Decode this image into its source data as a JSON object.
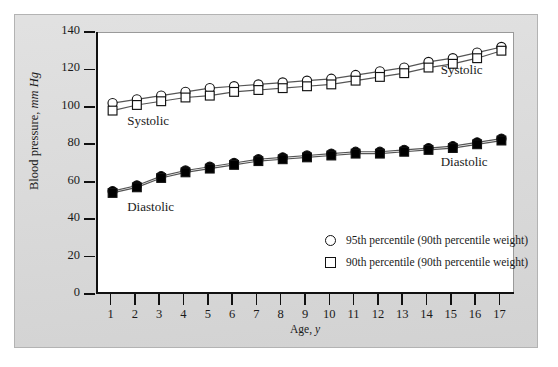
{
  "chart_data": {
    "type": "line",
    "title": "",
    "xlabel": "Age, y",
    "ylabel": "Blood pressure, mm Hg",
    "xlim": [
      0.4,
      17.6
    ],
    "ylim": [
      0,
      140
    ],
    "xticks": [
      1,
      2,
      3,
      4,
      5,
      6,
      7,
      8,
      9,
      10,
      11,
      12,
      13,
      14,
      15,
      16,
      17
    ],
    "yticks": [
      0,
      20,
      40,
      60,
      80,
      100,
      120,
      140
    ],
    "grid": false,
    "legend_position": "inside-bottom-right",
    "x": [
      1,
      2,
      3,
      4,
      5,
      6,
      7,
      8,
      9,
      10,
      11,
      12,
      13,
      14,
      15,
      16,
      17
    ],
    "series": [
      {
        "name": "Systolic 95th percentile (90th percentile weight)",
        "group": "Systolic",
        "marker": "open-circle",
        "values": [
          102,
          104,
          106,
          108,
          110,
          111,
          112,
          113,
          114,
          115,
          117,
          119,
          121,
          124,
          126,
          129,
          132
        ]
      },
      {
        "name": "Systolic 90th percentile (90th percentile weight)",
        "group": "Systolic",
        "marker": "open-square",
        "values": [
          98,
          101,
          103,
          105,
          106,
          108,
          109,
          110,
          111,
          112,
          114,
          116,
          118,
          121,
          123,
          126,
          130
        ]
      },
      {
        "name": "Diastolic 95th percentile (90th percentile weight)",
        "group": "Diastolic",
        "marker": "filled-circle",
        "values": [
          55,
          58,
          63,
          66,
          68,
          70,
          72,
          73,
          74,
          75,
          76,
          76,
          77,
          78,
          79,
          81,
          83
        ]
      },
      {
        "name": "Diastolic 90th percentile (90th percentile weight)",
        "group": "Diastolic",
        "marker": "filled-square",
        "values": [
          54,
          57,
          62,
          65,
          67,
          69,
          71,
          72,
          73,
          74,
          75,
          75,
          76,
          77,
          78,
          80,
          82
        ]
      }
    ],
    "annotations": [
      {
        "id": "systolic-left",
        "text": "Systolic",
        "x": 1.6,
        "y": 92
      },
      {
        "id": "diastolic-left",
        "text": "Diastolic",
        "x": 1.6,
        "y": 46
      },
      {
        "id": "systolic-right",
        "text": "Systolic",
        "x": 14.5,
        "y": 119
      },
      {
        "id": "diastolic-right",
        "text": "Diastolic",
        "x": 14.5,
        "y": 70
      }
    ],
    "legend": [
      {
        "marker": "open-circle",
        "label": "95th percentile (90th percentile weight)"
      },
      {
        "marker": "open-square",
        "label": "90th percentile (90th percentile weight)"
      }
    ],
    "colors": {
      "line": "#555555",
      "marker_stroke": "#111111",
      "marker_open_fill": "#ffffff",
      "marker_filled_fill": "#000000",
      "axis": "#111111",
      "panel_background": "#d9d9d9",
      "plot_background": "#ffffff",
      "text": "#1a1a1a"
    }
  }
}
